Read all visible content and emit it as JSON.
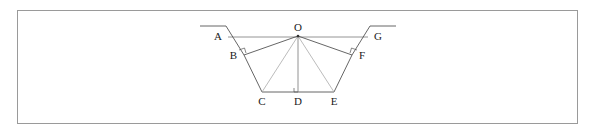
{
  "figure": {
    "caption": "",
    "frame": {
      "border_color": "#9a9a9a"
    },
    "background_color": "#ffffff",
    "line_color_main": "#555555",
    "line_color_light": "#aaaaaa",
    "label_color": "#1a1a1a"
  },
  "labels": {
    "A": "A",
    "B": "B",
    "C": "C",
    "D": "D",
    "E": "E",
    "F": "F",
    "G": "G",
    "O": "O"
  },
  "geometry": {
    "points": {
      "A": {
        "x": 228,
        "y": 37
      },
      "B": {
        "x": 244,
        "y": 55
      },
      "C": {
        "x": 262,
        "y": 92
      },
      "D": {
        "x": 298,
        "y": 92
      },
      "E": {
        "x": 334,
        "y": 92
      },
      "F": {
        "x": 352,
        "y": 55
      },
      "G": {
        "x": 368,
        "y": 37
      },
      "O": {
        "x": 298,
        "y": 36
      }
    },
    "ground_left": {
      "x1": 200,
      "y1": 26,
      "x2": 226,
      "y2": 26
    },
    "ground_right": {
      "x1": 370,
      "y1": 26,
      "x2": 396,
      "y2": 26
    },
    "right_angle_marks": [
      "B",
      "D",
      "F"
    ]
  },
  "edges": [
    {
      "from": "A",
      "to": "G",
      "style": "main"
    },
    {
      "from": "A",
      "to": "B",
      "style": "main"
    },
    {
      "from": "B",
      "to": "C",
      "style": "main"
    },
    {
      "from": "C",
      "to": "D",
      "style": "main"
    },
    {
      "from": "D",
      "to": "E",
      "style": "main"
    },
    {
      "from": "E",
      "to": "F",
      "style": "main"
    },
    {
      "from": "F",
      "to": "G",
      "style": "main"
    },
    {
      "from": "O",
      "to": "B",
      "style": "main"
    },
    {
      "from": "O",
      "to": "F",
      "style": "main"
    },
    {
      "from": "O",
      "to": "C",
      "style": "light"
    },
    {
      "from": "O",
      "to": "E",
      "style": "light"
    },
    {
      "from": "O",
      "to": "D",
      "style": "light"
    }
  ]
}
